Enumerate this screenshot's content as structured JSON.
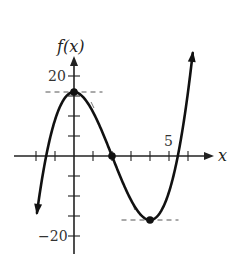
{
  "chart_data": {
    "type": "line",
    "title": "",
    "xlabel": "x",
    "ylabel": "f(x)",
    "function": "f(x) = x^3 - 6x^2 + 16",
    "xlim": [
      -3.5,
      6.5
    ],
    "ylim": [
      -24,
      25
    ],
    "x_tick_step": 1,
    "y_tick_step": 5,
    "x_tick_labels": [
      {
        "value": 5,
        "label": "5"
      }
    ],
    "y_tick_labels": [
      {
        "value": 20,
        "label": "20"
      },
      {
        "value": -20,
        "label": "−20"
      }
    ],
    "grid": false,
    "legend": null,
    "series": [
      {
        "name": "f(x)",
        "x": [
          -2.0,
          -1.5,
          -1.0,
          -0.5,
          0,
          0.5,
          1.0,
          1.5,
          2.0,
          2.5,
          3.0,
          3.5,
          4.0,
          4.5,
          5.0,
          5.5,
          6.0,
          6.3
        ],
        "values": [
          -16,
          -0.88,
          9,
          14.38,
          16,
          14.63,
          11,
          5.88,
          0,
          -6.13,
          -11,
          -14.63,
          -16,
          -14.38,
          -9,
          0.88,
          16,
          25.9
        ]
      }
    ],
    "marked_points": [
      {
        "label": "local maximum",
        "x": 0,
        "y": 16
      },
      {
        "label": "root",
        "x": 2,
        "y": 0
      },
      {
        "label": "local minimum",
        "x": 4,
        "y": -16
      }
    ],
    "dashed_tangent_lines": [
      {
        "y": 16,
        "x_from": -1.5,
        "x_to": 1.5
      },
      {
        "y": -16,
        "x_from": 2.5,
        "x_to": 5.5
      }
    ],
    "annotations": [
      "f(x)",
      "x",
      "20",
      "−20",
      "5"
    ]
  },
  "labels": {
    "y_axis": "f(x)",
    "x_axis": "x",
    "y_top": "20",
    "y_bottom": "−20",
    "x_five": "5"
  },
  "colors": {
    "curve": "#111111",
    "axis": "#222222",
    "dashed": "#555555",
    "background": "#ffffff"
  }
}
